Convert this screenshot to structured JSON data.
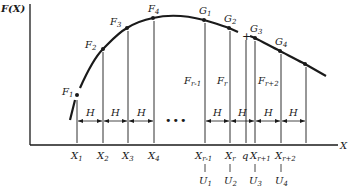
{
  "diagram": {
    "y_axis_label": "F(X)",
    "x_axis_label": "X",
    "interval_label": "H",
    "ellipsis": "•••",
    "curve_points": [
      {
        "name": "F",
        "sub": "1"
      },
      {
        "name": "F",
        "sub": "2"
      },
      {
        "name": "F",
        "sub": "3"
      },
      {
        "name": "F",
        "sub": "4"
      },
      {
        "name": "G",
        "sub": "1"
      },
      {
        "name": "G",
        "sub": "2"
      },
      {
        "name": "G",
        "sub": "3"
      },
      {
        "name": "G",
        "sub": "4"
      }
    ],
    "value_labels": [
      {
        "name": "F",
        "sub": "r-1"
      },
      {
        "name": "F",
        "sub": "r"
      },
      {
        "name": "F",
        "sub": "r+2"
      }
    ],
    "x_ticks": [
      {
        "name": "X",
        "sub": "1"
      },
      {
        "name": "X",
        "sub": "2"
      },
      {
        "name": "X",
        "sub": "3"
      },
      {
        "name": "X",
        "sub": "4"
      },
      {
        "name": "X",
        "sub": "r-1"
      },
      {
        "name": "X",
        "sub": "r"
      },
      {
        "name": "q",
        "sub": ""
      },
      {
        "name": "X",
        "sub": "r+1"
      },
      {
        "name": "X",
        "sub": "r+2"
      }
    ],
    "u_labels": [
      {
        "name": "U",
        "sub": "1"
      },
      {
        "name": "U",
        "sub": "2"
      },
      {
        "name": "U",
        "sub": "3"
      },
      {
        "name": "U",
        "sub": "4"
      }
    ],
    "interpolation_marker": "+"
  }
}
